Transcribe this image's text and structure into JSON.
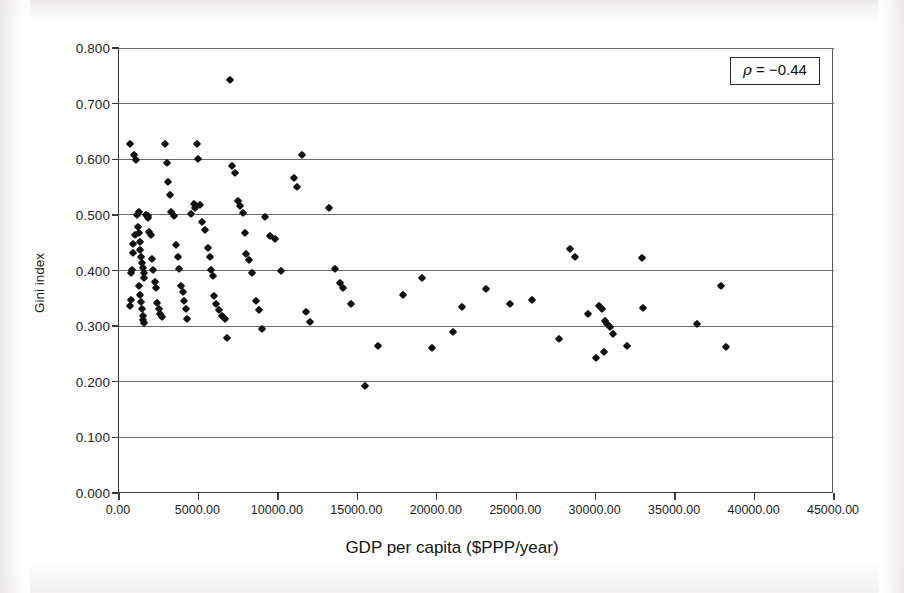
{
  "figure": {
    "axis_title_x": "GDP per capita ($PPP/year)",
    "axis_title_y": "Gini index",
    "annotation_rho_symbol": "ρ",
    "annotation_rho_text": " = −0.44"
  },
  "chart_data": {
    "type": "scatter",
    "title": "",
    "xlabel": "GDP per capita ($PPP/year)",
    "ylabel": "Gini index",
    "xlim": [
      0,
      45000
    ],
    "ylim": [
      0,
      0.8
    ],
    "xticks": [
      0,
      5000,
      10000,
      15000,
      20000,
      25000,
      30000,
      35000,
      40000,
      45000
    ],
    "xtick_labels": [
      "0.00",
      "5000.00",
      "10000.00",
      "15000.00",
      "20000.00",
      "25000.00",
      "30000.00",
      "35000.00",
      "40000.00",
      "45000.00"
    ],
    "yticks": [
      0.0,
      0.1,
      0.2,
      0.3,
      0.4,
      0.5,
      0.6,
      0.7,
      0.8
    ],
    "ytick_labels": [
      "0.000",
      "0.100",
      "0.200",
      "0.300",
      "0.400",
      "0.500",
      "0.600",
      "0.700",
      "0.800"
    ],
    "grid": "horizontal",
    "legend": "none",
    "marker": "diamond",
    "marker_color": "#111111",
    "annotations": [
      {
        "text": "ρ = −0.44",
        "position": "top-right",
        "boxed": true,
        "value": -0.44
      }
    ],
    "series": [
      {
        "name": "countries",
        "points": [
          [
            700,
            0.628
          ],
          [
            950,
            0.607
          ],
          [
            1100,
            0.598
          ],
          [
            1250,
            0.506
          ],
          [
            1000,
            0.464
          ],
          [
            900,
            0.447
          ],
          [
            850,
            0.432
          ],
          [
            800,
            0.401
          ],
          [
            780,
            0.395
          ],
          [
            760,
            0.347
          ],
          [
            700,
            0.337
          ],
          [
            1150,
            0.5
          ],
          [
            1200,
            0.478
          ],
          [
            1280,
            0.468
          ],
          [
            1320,
            0.452
          ],
          [
            1350,
            0.437
          ],
          [
            1400,
            0.425
          ],
          [
            1450,
            0.413
          ],
          [
            1500,
            0.404
          ],
          [
            1550,
            0.396
          ],
          [
            1600,
            0.386
          ],
          [
            1250,
            0.372
          ],
          [
            1300,
            0.356
          ],
          [
            1380,
            0.344
          ],
          [
            1420,
            0.33
          ],
          [
            1480,
            0.318
          ],
          [
            1520,
            0.311
          ],
          [
            1600,
            0.306
          ],
          [
            1700,
            0.5
          ],
          [
            1800,
            0.498
          ],
          [
            1850,
            0.494
          ],
          [
            1900,
            0.47
          ],
          [
            2000,
            0.463
          ],
          [
            2100,
            0.42
          ],
          [
            2150,
            0.401
          ],
          [
            2250,
            0.38
          ],
          [
            2300,
            0.368
          ],
          [
            2400,
            0.341
          ],
          [
            2500,
            0.331
          ],
          [
            2600,
            0.322
          ],
          [
            2700,
            0.316
          ],
          [
            2900,
            0.627
          ],
          [
            3000,
            0.594
          ],
          [
            3100,
            0.56
          ],
          [
            3200,
            0.536
          ],
          [
            3300,
            0.505
          ],
          [
            3450,
            0.498
          ],
          [
            3600,
            0.445
          ],
          [
            3700,
            0.424
          ],
          [
            3800,
            0.402
          ],
          [
            3900,
            0.372
          ],
          [
            4000,
            0.361
          ],
          [
            4100,
            0.345
          ],
          [
            4200,
            0.33
          ],
          [
            4300,
            0.312
          ],
          [
            4500,
            0.502
          ],
          [
            4700,
            0.52
          ],
          [
            4800,
            0.513
          ],
          [
            4900,
            0.628
          ],
          [
            5000,
            0.601
          ],
          [
            5100,
            0.517
          ],
          [
            5200,
            0.487
          ],
          [
            5400,
            0.472
          ],
          [
            5600,
            0.441
          ],
          [
            5700,
            0.425
          ],
          [
            5800,
            0.401
          ],
          [
            5900,
            0.39
          ],
          [
            6000,
            0.354
          ],
          [
            6100,
            0.34
          ],
          [
            6300,
            0.329
          ],
          [
            6500,
            0.319
          ],
          [
            6700,
            0.312
          ],
          [
            7000,
            0.742
          ],
          [
            7100,
            0.588
          ],
          [
            7300,
            0.575
          ],
          [
            7500,
            0.525
          ],
          [
            7600,
            0.516
          ],
          [
            7800,
            0.503
          ],
          [
            7900,
            0.468
          ],
          [
            8000,
            0.43
          ],
          [
            8200,
            0.419
          ],
          [
            8400,
            0.396
          ],
          [
            8600,
            0.345
          ],
          [
            8800,
            0.329
          ],
          [
            9000,
            0.294
          ],
          [
            6800,
            0.279
          ],
          [
            9200,
            0.497
          ],
          [
            9500,
            0.462
          ],
          [
            9800,
            0.456
          ],
          [
            10200,
            0.399
          ],
          [
            11000,
            0.566
          ],
          [
            11200,
            0.551
          ],
          [
            11500,
            0.607
          ],
          [
            11800,
            0.325
          ],
          [
            12000,
            0.307
          ],
          [
            13200,
            0.512
          ],
          [
            13600,
            0.402
          ],
          [
            13900,
            0.378
          ],
          [
            14100,
            0.368
          ],
          [
            14600,
            0.34
          ],
          [
            15500,
            0.192
          ],
          [
            16300,
            0.264
          ],
          [
            17900,
            0.356
          ],
          [
            19100,
            0.387
          ],
          [
            19700,
            0.261
          ],
          [
            21000,
            0.289
          ],
          [
            21600,
            0.335
          ],
          [
            23100,
            0.366
          ],
          [
            24600,
            0.34
          ],
          [
            26000,
            0.347
          ],
          [
            27700,
            0.276
          ],
          [
            28400,
            0.438
          ],
          [
            28700,
            0.424
          ],
          [
            29500,
            0.322
          ],
          [
            30200,
            0.337
          ],
          [
            30400,
            0.331
          ],
          [
            30600,
            0.31
          ],
          [
            30700,
            0.304
          ],
          [
            30900,
            0.298
          ],
          [
            31100,
            0.286
          ],
          [
            30000,
            0.243
          ],
          [
            30500,
            0.253
          ],
          [
            32000,
            0.265
          ],
          [
            32900,
            0.423
          ],
          [
            33000,
            0.333
          ],
          [
            36400,
            0.303
          ],
          [
            37900,
            0.372
          ],
          [
            38200,
            0.263
          ]
        ]
      }
    ]
  }
}
